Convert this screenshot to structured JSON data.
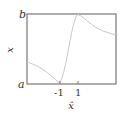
{
  "chart_data": {
    "type": "line",
    "title": "",
    "xlabel": "x̂",
    "ylabel": "x",
    "x_ticks": [
      "-1",
      "1"
    ],
    "y_ticks": [
      "a",
      "b"
    ],
    "grid": false,
    "legend": null,
    "series": [
      {
        "name": "curve",
        "color": "#c8c8c8",
        "description": "Starts mid-low at left edge, decreases to a at x̂=-1, rises steeply to b at x̂=1, then decays toward the right edge",
        "points_px": [
          [
            27,
            62
          ],
          [
            38,
            66
          ],
          [
            48,
            73
          ],
          [
            56,
            80
          ],
          [
            60,
            84
          ],
          [
            64,
            72
          ],
          [
            68,
            52
          ],
          [
            72,
            30
          ],
          [
            76,
            16
          ],
          [
            78,
            14
          ],
          [
            84,
            18
          ],
          [
            92,
            25
          ],
          [
            102,
            31
          ],
          [
            116,
            35
          ]
        ]
      }
    ],
    "colors": {
      "frame": "#777777",
      "curve": "#c8c8c8",
      "text": "#333333"
    }
  }
}
